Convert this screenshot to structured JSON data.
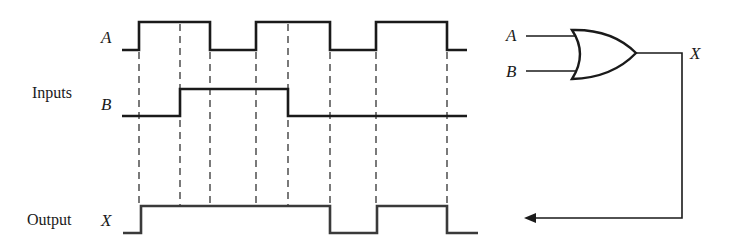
{
  "labels": {
    "inputs": "Inputs",
    "output": "Output",
    "signal_a": "A",
    "signal_b": "B",
    "signal_x": "X",
    "gate_in_a": "A",
    "gate_in_b": "B",
    "gate_out_x": "X"
  },
  "gate": {
    "type": "OR",
    "inputs": [
      "A",
      "B"
    ],
    "output": "X"
  },
  "waveforms": {
    "A": {
      "levels": [
        0,
        1,
        0,
        1,
        0,
        1,
        0
      ],
      "transitions_x": [
        139,
        210,
        256,
        330,
        376,
        447
      ]
    },
    "B": {
      "levels": [
        0,
        1,
        0
      ],
      "transitions_x": [
        180,
        288
      ]
    },
    "X": {
      "levels": [
        0,
        1,
        0,
        1,
        0
      ],
      "transitions_x": [
        141,
        330,
        377,
        447
      ]
    }
  },
  "dashed_guides_x": [
    139,
    180,
    210,
    256,
    288,
    330,
    376,
    447
  ],
  "colors": {
    "line": "#1a1a1a",
    "dash": "#333333",
    "background": "#ffffff"
  }
}
